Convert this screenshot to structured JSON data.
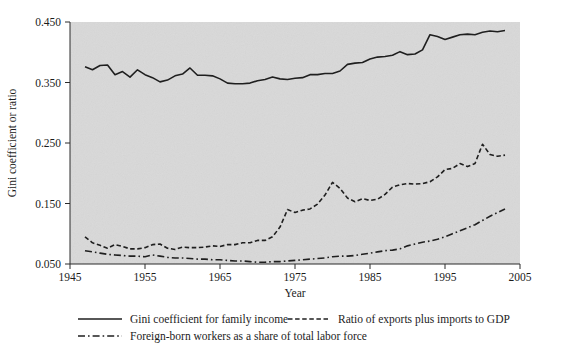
{
  "chart_data": {
    "type": "line",
    "title": "",
    "xlabel": "Year",
    "ylabel": "Gini coefficient or ratio",
    "xlim": [
      1945,
      2005
    ],
    "ylim": [
      0.05,
      0.45
    ],
    "xticks": [
      "1945",
      "1955",
      "1965",
      "1975",
      "1985",
      "1995",
      "2005"
    ],
    "yticks": [
      "0.050",
      "0.150",
      "0.250",
      "0.350",
      "0.450"
    ],
    "grid": false,
    "legend_position": "below",
    "plot_background": "#d9d9d9",
    "line_color": "#1f1f1f",
    "series": [
      {
        "name": "Gini coefficient for family income",
        "style": "solid",
        "x": [
          1947,
          1948,
          1949,
          1950,
          1951,
          1952,
          1953,
          1954,
          1955,
          1956,
          1957,
          1958,
          1959,
          1960,
          1961,
          1962,
          1963,
          1964,
          1965,
          1966,
          1967,
          1968,
          1969,
          1970,
          1971,
          1972,
          1973,
          1974,
          1975,
          1976,
          1977,
          1978,
          1979,
          1980,
          1981,
          1982,
          1983,
          1984,
          1985,
          1986,
          1987,
          1988,
          1989,
          1990,
          1991,
          1992,
          1993,
          1994,
          1995,
          1996,
          1997,
          1998,
          1999,
          2000,
          2001,
          2002,
          2003
        ],
        "values": [
          0.376,
          0.371,
          0.378,
          0.379,
          0.363,
          0.368,
          0.359,
          0.371,
          0.363,
          0.358,
          0.351,
          0.354,
          0.361,
          0.364,
          0.374,
          0.362,
          0.362,
          0.361,
          0.356,
          0.349,
          0.348,
          0.348,
          0.349,
          0.353,
          0.355,
          0.359,
          0.356,
          0.355,
          0.357,
          0.358,
          0.363,
          0.363,
          0.365,
          0.365,
          0.369,
          0.38,
          0.382,
          0.383,
          0.389,
          0.392,
          0.393,
          0.395,
          0.401,
          0.396,
          0.397,
          0.404,
          0.429,
          0.426,
          0.421,
          0.425,
          0.429,
          0.43,
          0.429,
          0.433,
          0.435,
          0.434,
          0.436
        ]
      },
      {
        "name": "Ratio of exports plus imports to GDP",
        "style": "dashed",
        "x": [
          1947,
          1948,
          1949,
          1950,
          1951,
          1952,
          1953,
          1954,
          1955,
          1956,
          1957,
          1958,
          1959,
          1960,
          1961,
          1962,
          1963,
          1964,
          1965,
          1966,
          1967,
          1968,
          1969,
          1970,
          1971,
          1972,
          1973,
          1974,
          1975,
          1976,
          1977,
          1978,
          1979,
          1980,
          1981,
          1982,
          1983,
          1984,
          1985,
          1986,
          1987,
          1988,
          1989,
          1990,
          1991,
          1992,
          1993,
          1994,
          1995,
          1996,
          1997,
          1998,
          1999,
          2000,
          2001,
          2002,
          2003
        ],
        "values": [
          0.095,
          0.085,
          0.081,
          0.076,
          0.082,
          0.079,
          0.075,
          0.075,
          0.077,
          0.082,
          0.083,
          0.076,
          0.074,
          0.078,
          0.077,
          0.077,
          0.078,
          0.08,
          0.079,
          0.082,
          0.082,
          0.085,
          0.085,
          0.089,
          0.089,
          0.095,
          0.111,
          0.14,
          0.135,
          0.139,
          0.141,
          0.149,
          0.164,
          0.185,
          0.175,
          0.159,
          0.153,
          0.158,
          0.155,
          0.157,
          0.165,
          0.177,
          0.181,
          0.183,
          0.182,
          0.183,
          0.186,
          0.194,
          0.206,
          0.208,
          0.216,
          0.211,
          0.216,
          0.248,
          0.231,
          0.228,
          0.23
        ]
      },
      {
        "name": "Foreign-born workers as a share of total labor force",
        "style": "dashdot",
        "x": [
          1947,
          1948,
          1949,
          1950,
          1951,
          1952,
          1953,
          1954,
          1955,
          1956,
          1957,
          1958,
          1959,
          1960,
          1961,
          1962,
          1963,
          1964,
          1965,
          1966,
          1967,
          1968,
          1969,
          1970,
          1971,
          1972,
          1973,
          1974,
          1975,
          1976,
          1977,
          1978,
          1979,
          1980,
          1981,
          1982,
          1983,
          1984,
          1985,
          1986,
          1987,
          1988,
          1989,
          1990,
          1991,
          1992,
          1993,
          1994,
          1995,
          1996,
          1997,
          1998,
          1999,
          2000,
          2001,
          2002,
          2003
        ],
        "values": [
          0.072,
          0.07,
          0.068,
          0.066,
          0.065,
          0.064,
          0.063,
          0.063,
          0.062,
          0.065,
          0.063,
          0.061,
          0.06,
          0.06,
          0.059,
          0.058,
          0.058,
          0.057,
          0.057,
          0.056,
          0.055,
          0.055,
          0.054,
          0.053,
          0.053,
          0.054,
          0.054,
          0.055,
          0.056,
          0.057,
          0.058,
          0.059,
          0.06,
          0.062,
          0.063,
          0.063,
          0.064,
          0.066,
          0.068,
          0.07,
          0.072,
          0.073,
          0.075,
          0.08,
          0.083,
          0.086,
          0.088,
          0.091,
          0.095,
          0.1,
          0.105,
          0.11,
          0.115,
          0.122,
          0.129,
          0.135,
          0.141
        ]
      }
    ]
  },
  "legend": {
    "items": [
      {
        "label": "Gini coefficient for family income",
        "style": "solid"
      },
      {
        "label": "Ratio of exports plus imports to GDP",
        "style": "dashed"
      },
      {
        "label": "Foreign-born workers as a share of total labor force",
        "style": "dashdot"
      }
    ]
  }
}
